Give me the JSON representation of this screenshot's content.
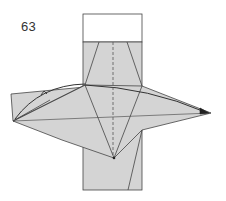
{
  "step": {
    "number": "63"
  },
  "diagram": {
    "colors": {
      "paper_colored": "#d4d4d4",
      "paper_white": "#ffffff",
      "line": "#333333",
      "fold_line": "#555555"
    },
    "instruction": "Valley-fold the left point over to the right point along the dashed centerline",
    "elements": [
      "white-top-flap",
      "vertical-gray-strip",
      "left-flap",
      "diamond-kite-layer",
      "dashed-valley-fold-line",
      "curved-fold-arrow"
    ]
  }
}
